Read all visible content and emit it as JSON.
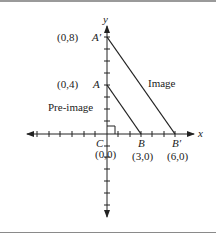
{
  "figure": {
    "axes": {
      "x_label": "x",
      "y_label": "y"
    },
    "points": {
      "A_prime": {
        "name": "A′",
        "coord": "(0,8)"
      },
      "A": {
        "name": "A",
        "coord": "(0,4)"
      },
      "B": {
        "name": "B",
        "coord": "(3,0)"
      },
      "B_prime": {
        "name": "B′",
        "coord": "(6,0)"
      },
      "C": {
        "name": "C",
        "coord": "(0,0)"
      }
    },
    "labels": {
      "image": "Image",
      "pre_image": "Pre-image"
    }
  }
}
